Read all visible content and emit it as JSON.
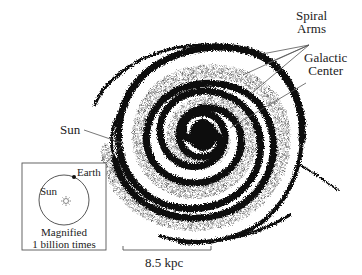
{
  "diagram": {
    "type": "spiral-galaxy-illustration",
    "labels": {
      "spiral_arms_line1": "Spiral",
      "spiral_arms_line2": "Arms",
      "galactic_center_line1": "Galactic",
      "galactic_center_line2": "Center",
      "sun": "Sun"
    },
    "inset": {
      "earth": "Earth",
      "sun": "Sun",
      "caption_line1": "Magnified",
      "caption_line2": "1 billion times"
    },
    "scale_bar": {
      "label": "8.5 kpc"
    },
    "colors": {
      "ink": "#111111",
      "background": "#ffffff",
      "line": "#555555"
    }
  }
}
